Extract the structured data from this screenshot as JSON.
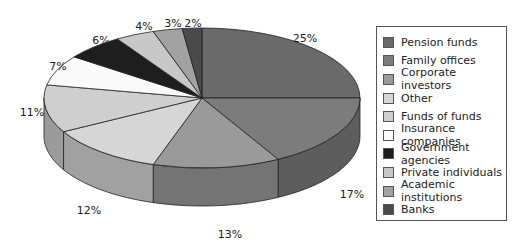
{
  "chart_data": {
    "type": "pie",
    "title": "",
    "three_d": true,
    "start_angle": "12 o'clock, clockwise",
    "categories": [
      "Pension funds",
      "Family offices",
      "Corporate investors",
      "Other",
      "Funds of funds",
      "Insurance companies",
      "Government agencies",
      "Private individuals",
      "Academic institutions",
      "Banks"
    ],
    "values": [
      25,
      17,
      13,
      12,
      11,
      7,
      6,
      4,
      3,
      2
    ],
    "value_labels": [
      "25%",
      "17%",
      "13%",
      "12%",
      "11%",
      "7%",
      "6%",
      "4%",
      "3%",
      "2%"
    ],
    "colors": [
      "#6a6a6a",
      "#7c7c7c",
      "#9a9a9a",
      "#d6d6d6",
      "#cfcfcf",
      "#fafafa",
      "#1e1e1e",
      "#c8c8c8",
      "#a2a2a2",
      "#4a4a4a"
    ],
    "legend_position": "right"
  },
  "legend": {
    "items": [
      {
        "label": "Pension funds"
      },
      {
        "label": "Family offices"
      },
      {
        "label": "Corporate investors"
      },
      {
        "label": "Other"
      },
      {
        "label": "Funds of funds"
      },
      {
        "label": "Insurance companies"
      },
      {
        "label": "Government agencies"
      },
      {
        "label": "Private individuals"
      },
      {
        "label": "Academic institutions"
      },
      {
        "label": "Banks"
      }
    ]
  },
  "labels": {
    "l0": "25%",
    "l1": "17%",
    "l2": "13%",
    "l3": "12%",
    "l4": "11%",
    "l5": "7%",
    "l6": "6%",
    "l7": "4%",
    "l8": "3%",
    "l9": "2%"
  }
}
